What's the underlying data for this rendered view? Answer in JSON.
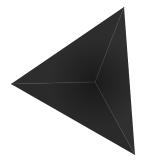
{
  "image": {
    "subject": "tetrahedron",
    "background": "#ffffff",
    "vertices": {
      "top": [
        124,
        7
      ],
      "bottom": [
        135,
        155
      ],
      "left": [
        11,
        84
      ],
      "apex": [
        95,
        82
      ]
    },
    "colors": {
      "face_top": "#2e2e2e",
      "face_right": "#303030",
      "face_bottom": "#2a2a2a",
      "apex_shadow": "#161616",
      "edge": "#3a3a3a"
    }
  }
}
